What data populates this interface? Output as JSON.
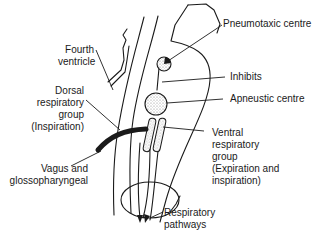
{
  "diagram": {
    "type": "anatomical-schematic",
    "colors": {
      "line": "#1a1a1a",
      "background": "#ffffff",
      "stipple": "#9a9a9a"
    }
  },
  "labels": {
    "pneumotaxic": "Pneumotaxic centre",
    "fourth_ventricle": "Fourth\nventricle",
    "inhibits": "Inhibits",
    "dorsal": "Dorsal\nrespiratory\ngroup\n(Inspiration)",
    "apneustic": "Apneustic centre",
    "ventral": "Ventral\nrespiratory\ngroup\n(Expiration and\ninspiration)",
    "vagus": "Vagus and\nglossopharyngeal",
    "pathways": "Respiratory\npathways"
  }
}
